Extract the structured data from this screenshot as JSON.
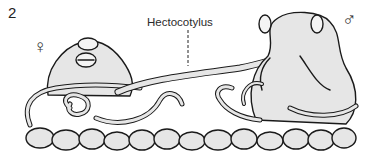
{
  "figure": {
    "number": "2",
    "labels": {
      "hectocotylus": "Hectocotylus",
      "female_symbol": "♀",
      "male_symbol": "♂"
    },
    "subjects": [
      {
        "name": "female-octopus",
        "sex": "female",
        "position": "left"
      },
      {
        "name": "male-octopus",
        "sex": "male",
        "position": "right"
      }
    ],
    "colors": {
      "outline": "#1a1a1a",
      "body_fill": "#e6e6e6",
      "background": "#ffffff"
    }
  }
}
